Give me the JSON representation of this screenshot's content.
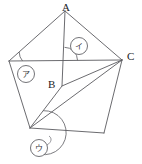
{
  "figure": {
    "width": 142,
    "height": 164,
    "background_color": "#ffffff",
    "stroke_color": "#5a5a5f",
    "label_color": "#1b1b1f",
    "vertex_labels": [
      {
        "id": "A",
        "text": "A",
        "x": 62,
        "y": 2
      },
      {
        "id": "B",
        "text": "B",
        "x": 48,
        "y": 79
      },
      {
        "id": "C",
        "text": "C",
        "x": 127,
        "y": 51
      }
    ],
    "angle_markers": [
      {
        "id": "marker-a",
        "text": "ア",
        "circle_x": 26,
        "circle_y": 74,
        "radius": 8.5
      },
      {
        "id": "marker-i",
        "text": "イ",
        "circle_x": 79,
        "circle_y": 46,
        "radius": 8.5
      },
      {
        "id": "marker-u",
        "text": "ウ",
        "circle_x": 39,
        "circle_y": 148,
        "radius": 8.5
      }
    ],
    "pentagon_vertices": [
      {
        "name": "A",
        "x": 65,
        "y": 11
      },
      {
        "name": "C",
        "x": 122,
        "y": 60
      },
      {
        "name": "D",
        "x": 104,
        "y": 133
      },
      {
        "name": "E",
        "x": 30,
        "y": 128
      },
      {
        "name": "F",
        "x": 9,
        "y": 61
      }
    ],
    "interior_points": [
      {
        "name": "B",
        "x": 62,
        "y": 86
      }
    ],
    "chords": [
      {
        "from": "F",
        "to": "C",
        "desc": "horizontal-chord"
      },
      {
        "from": "A",
        "to": "E",
        "desc": "chord-A-to-E-through-B"
      },
      {
        "from": "B",
        "to": "C",
        "desc": "chord-B-to-C"
      },
      {
        "from": "E",
        "to": "C",
        "desc": "chord-E-to-C"
      }
    ]
  }
}
